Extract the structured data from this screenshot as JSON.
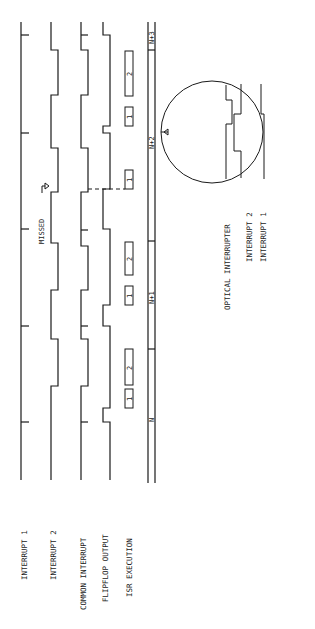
{
  "signals": {
    "interrupt_1": "INTERRUPT 1",
    "interrupt_2": "INTERRUPT 2",
    "common_interrupt": "COMMON INTERRUPT",
    "flipflop_output": "FLIPFLOP OUTPUT",
    "isr_execution": "ISR EXECUTION"
  },
  "annotations": {
    "missed": "MISSED"
  },
  "isr_boxes": [
    "1",
    "2",
    "1",
    "2",
    "1",
    "1",
    "2"
  ],
  "time_periods": [
    "N",
    "N+1",
    "N+2",
    "N+3"
  ],
  "inset": {
    "title": "OPTICAL INTERRUPTER",
    "interrupt_2": "INTERRUPT 2",
    "interrupt_1": "INTERRUPT 1"
  },
  "colors": {
    "ink": "#1a1a1a",
    "background": "#ffffff"
  }
}
